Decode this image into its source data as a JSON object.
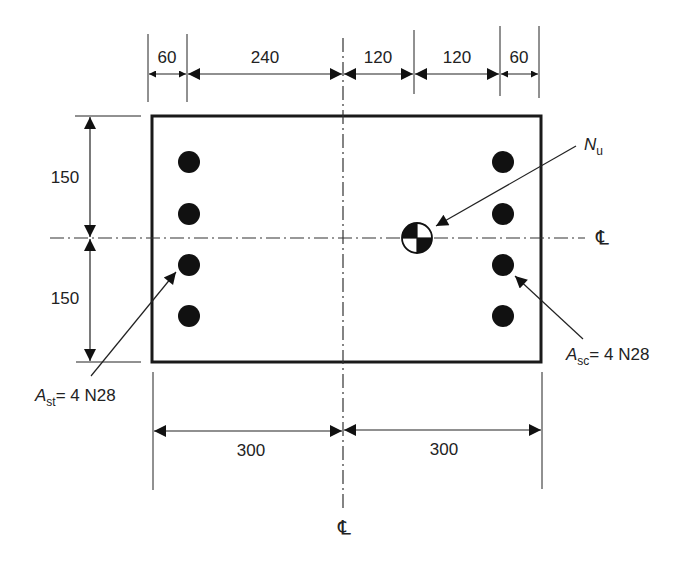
{
  "diagram": {
    "type": "reinforced-concrete-column-cross-section",
    "top_dimensions": [
      "60",
      "240",
      "120",
      "120",
      "60"
    ],
    "left_dimensions": [
      "150",
      "150"
    ],
    "bottom_dimensions": [
      "300",
      "300"
    ],
    "centerline_symbol": "℄",
    "load_label": {
      "main": "N",
      "sub": "u"
    },
    "tension_steel_label": {
      "main": "A",
      "sub": "st",
      "rest": "= 4 N28"
    },
    "compression_steel_label": {
      "main": "A",
      "sub": "sc",
      "rest": "= 4 N28"
    },
    "bars_per_face": 4,
    "colors": {
      "line": "#1a1a1a",
      "bar": "#111111",
      "background": "#ffffff"
    }
  }
}
